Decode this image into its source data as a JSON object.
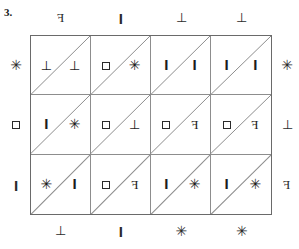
{
  "puzzle": {
    "problem_number": "3.",
    "grid": {
      "rows": 3,
      "columns": 4,
      "diagonal_direction": "bottom-left-to-top-right",
      "cells": [
        [
          {
            "upper": "tack",
            "lower": "tack"
          },
          {
            "upper": "square",
            "lower": "star"
          },
          {
            "upper": "bar",
            "lower": "bar"
          },
          {
            "upper": "bar",
            "lower": "bar"
          }
        ],
        [
          {
            "upper": "bar",
            "lower": "star"
          },
          {
            "upper": "square",
            "lower": "tack"
          },
          {
            "upper": "square",
            "lower": "efr"
          },
          {
            "upper": "square",
            "lower": "efr"
          }
        ],
        [
          {
            "upper": "star",
            "lower": "bar"
          },
          {
            "upper": "square",
            "lower": "efr"
          },
          {
            "upper": "bar",
            "lower": "star"
          },
          {
            "upper": "bar",
            "lower": "star"
          }
        ]
      ]
    },
    "labels": {
      "top": [
        "efr",
        "bar",
        "tack",
        "tack"
      ],
      "bottom": [
        "tack",
        "bar",
        "star",
        "star"
      ],
      "left": [
        "star",
        "square",
        "bar"
      ],
      "right": [
        "star",
        "tack",
        "efr"
      ]
    },
    "glyph_text": {
      "bar": "I",
      "tack": "⊥",
      "square": "",
      "star": "✳",
      "efr": "F"
    },
    "colors": {
      "outer_border": "#6a6a6a",
      "inner_line": "#8d8d8d",
      "diagonal_line": "#8d8d8d",
      "symbol": "#1c1c1c",
      "background": "#ffffff"
    }
  }
}
